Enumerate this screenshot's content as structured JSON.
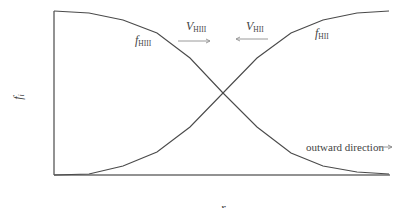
{
  "diagram": {
    "type": "line",
    "x_axis_label": "r",
    "y_axis_label": "f",
    "y_axis_label_sub": "i",
    "curves": [
      {
        "name": "f_HIII",
        "label_main": "f",
        "label_sub": "HIII",
        "trend": "decreasing",
        "points": [
          [
            54,
            11
          ],
          [
            89,
            13
          ],
          [
            123,
            20
          ],
          [
            157,
            33
          ],
          [
            190,
            58
          ],
          [
            223,
            93
          ],
          [
            257,
            127
          ],
          [
            291,
            153
          ],
          [
            323,
            166
          ],
          [
            357,
            172
          ],
          [
            389,
            174
          ]
        ]
      },
      {
        "name": "f_HII",
        "label_main": "f",
        "label_sub": "HII",
        "trend": "increasing",
        "points": [
          [
            54,
            175
          ],
          [
            89,
            174
          ],
          [
            123,
            166
          ],
          [
            157,
            152
          ],
          [
            190,
            127
          ],
          [
            223,
            93
          ],
          [
            257,
            58
          ],
          [
            291,
            33
          ],
          [
            323,
            20
          ],
          [
            357,
            13
          ],
          [
            389,
            11
          ]
        ]
      }
    ],
    "velocity_arrows": [
      {
        "label_main": "V",
        "label_sub": "HIII",
        "direction": "right"
      },
      {
        "label_main": "V",
        "label_sub": "HII",
        "direction": "left"
      }
    ],
    "annotation": {
      "text": "outward direction",
      "arrow": "-->"
    },
    "colors": {
      "axis": "#6e6e6e",
      "curve": "#4a4a4a",
      "arrow": "#9a9a9a",
      "text": "#444444"
    }
  }
}
